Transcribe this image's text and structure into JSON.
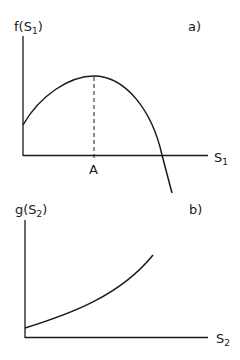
{
  "colors": {
    "ink": "#1a1a1a",
    "background": "#ffffff"
  },
  "panel_a": {
    "tag": "a)",
    "y_label": {
      "fn": "f(S",
      "sub": "1",
      "close": ")"
    },
    "x_label": {
      "var": "S",
      "sub": "1"
    },
    "marker_label": "A",
    "curve_description": "concave curve rising to maximum at A, then falling below the S1 axis"
  },
  "panel_b": {
    "tag": "b)",
    "y_label": {
      "fn": "g(S",
      "sub": "2",
      "close": ")"
    },
    "x_label": {
      "var": "S",
      "sub": "2"
    },
    "curve_description": "convex increasing curve starting above origin"
  }
}
